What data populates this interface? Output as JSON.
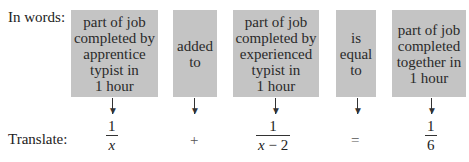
{
  "labels": {
    "in_words": "In words:",
    "translate": "Translate:"
  },
  "boxes": [
    {
      "lines": [
        "part of job",
        "completed by",
        "apprentice",
        "typist in",
        "1 hour"
      ]
    },
    {
      "lines": [
        "added",
        "to"
      ]
    },
    {
      "lines": [
        "part of job",
        "completed by",
        "experienced",
        "typist in",
        "1 hour"
      ]
    },
    {
      "lines": [
        "is",
        "equal",
        "to"
      ]
    },
    {
      "lines": [
        "part of job",
        "completed",
        "together in",
        "1 hour"
      ]
    }
  ],
  "translation": {
    "term1": {
      "numerator": "1",
      "denominator": "x"
    },
    "op1": "+",
    "term2": {
      "numerator": "1",
      "denominator_var": "x",
      "denominator_rest": " − 2"
    },
    "op2": "=",
    "term3": {
      "numerator": "1",
      "denominator": "6"
    }
  },
  "colors": {
    "box_fill": "#c4c4c4"
  }
}
